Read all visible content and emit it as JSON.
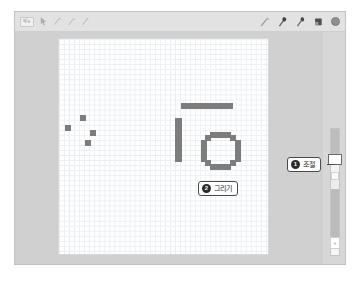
{
  "app": {
    "name": "pixel-drawing-app",
    "background_color": "#d0d0d0"
  },
  "toolbar": {
    "menu_label": "메뉴",
    "left_tools": [
      {
        "name": "pointer-icon",
        "label": "선택"
      },
      {
        "name": "lasso-icon",
        "label": "올가미"
      },
      {
        "name": "shape-icon",
        "label": "도형"
      },
      {
        "name": "text-icon",
        "label": "텍스트"
      }
    ],
    "right_tools": [
      {
        "name": "pen-icon",
        "label": "펜"
      },
      {
        "name": "marker-icon",
        "label": "마커"
      },
      {
        "name": "pencil-icon",
        "label": "연필"
      },
      {
        "name": "eraser-icon",
        "label": "지우개"
      }
    ],
    "color_swatch": {
      "name": "color-swatch",
      "label": "색상",
      "color": "#8f8f8f"
    }
  },
  "canvas": {
    "label": "그리기 캔버스",
    "grid_on": true,
    "grid_color": "#e9eef2",
    "grid_size_px": 5,
    "ink_color": "#7d7d7d",
    "strokes": [
      {
        "name": "dot-mark",
        "x": 6,
        "y": 86,
        "w": 6,
        "h": 6
      },
      {
        "name": "dot-mark",
        "x": 21,
        "y": 76,
        "w": 6,
        "h": 6
      },
      {
        "name": "dot-mark",
        "x": 31,
        "y": 91,
        "w": 6,
        "h": 6
      },
      {
        "name": "dot-mark",
        "x": 26,
        "y": 101,
        "w": 6,
        "h": 6
      },
      {
        "name": "horizontal-bar",
        "x": 122,
        "y": 64,
        "w": 52,
        "h": 6
      },
      {
        "name": "vertical-bar",
        "x": 116,
        "y": 79,
        "w": 7,
        "h": 44
      },
      {
        "name": "ring-top",
        "x": 151,
        "y": 93,
        "w": 21,
        "h": 6
      },
      {
        "name": "ring-bottom",
        "x": 151,
        "y": 125,
        "w": 21,
        "h": 6
      },
      {
        "name": "ring-left",
        "x": 142,
        "y": 101,
        "w": 6,
        "h": 22
      },
      {
        "name": "ring-right",
        "x": 176,
        "y": 101,
        "w": 6,
        "h": 22
      },
      {
        "name": "ring-corner-tl",
        "x": 146,
        "y": 96,
        "w": 6,
        "h": 6
      },
      {
        "name": "ring-corner-tr",
        "x": 171,
        "y": 96,
        "w": 6,
        "h": 6
      },
      {
        "name": "ring-corner-bl",
        "x": 146,
        "y": 121,
        "w": 6,
        "h": 6
      },
      {
        "name": "ring-corner-br",
        "x": 171,
        "y": 121,
        "w": 6,
        "h": 6
      }
    ]
  },
  "side_rail": {
    "label": "도구 조절 패널",
    "slider": {
      "name": "thickness-slider",
      "label": "굵기 조절 슬라이더",
      "orientation": "vertical"
    },
    "foot_button": {
      "name": "add-button",
      "label": "+"
    }
  },
  "callouts": [
    {
      "id": "callout-adjust",
      "number": "1",
      "text": "조절",
      "target": "thickness-slider"
    },
    {
      "id": "callout-draw",
      "number": "2",
      "text": "그리기",
      "target": "drawing-canvas"
    }
  ]
}
